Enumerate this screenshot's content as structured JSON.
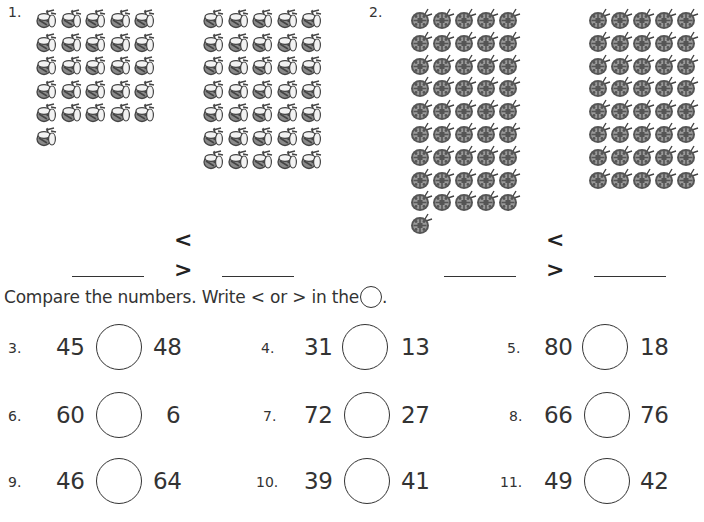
{
  "problems_top": [
    {
      "number": "1.",
      "icon": "bee-icon",
      "left_group": {
        "count": 26,
        "columns": 5
      },
      "right_group": {
        "count": 35,
        "columns": 5
      },
      "symbols": [
        "<",
        ">"
      ],
      "blanks": [
        "",
        ""
      ]
    },
    {
      "number": "2.",
      "icon": "ladybug-icon",
      "left_group": {
        "count": 46,
        "columns": 5
      },
      "right_group": {
        "count": 40,
        "columns": 5
      },
      "symbols": [
        "<",
        ">"
      ],
      "blanks": [
        "",
        ""
      ]
    }
  ],
  "instruction": {
    "text": "Compare the numbers. Write < or > in the",
    "suffix": "."
  },
  "comparisons": [
    {
      "number": "3.",
      "a": "45",
      "b": "48",
      "answer": ""
    },
    {
      "number": "4.",
      "a": "31",
      "b": "13",
      "answer": ""
    },
    {
      "number": "5.",
      "a": "80",
      "b": "18",
      "answer": ""
    },
    {
      "number": "6.",
      "a": "60",
      "b": "6",
      "answer": ""
    },
    {
      "number": "7.",
      "a": "72",
      "b": "27",
      "answer": ""
    },
    {
      "number": "8.",
      "a": "66",
      "b": "76",
      "answer": ""
    },
    {
      "number": "9.",
      "a": "46",
      "b": "64",
      "answer": ""
    },
    {
      "number": "10.",
      "a": "39",
      "b": "41",
      "answer": ""
    },
    {
      "number": "11.",
      "a": "49",
      "b": "42",
      "answer": ""
    }
  ],
  "colors": {
    "ink": "#333333",
    "bee_body": "#7a7a7a",
    "ladybug_shell": "#8a8a8a",
    "ladybug_dark": "#444444"
  }
}
